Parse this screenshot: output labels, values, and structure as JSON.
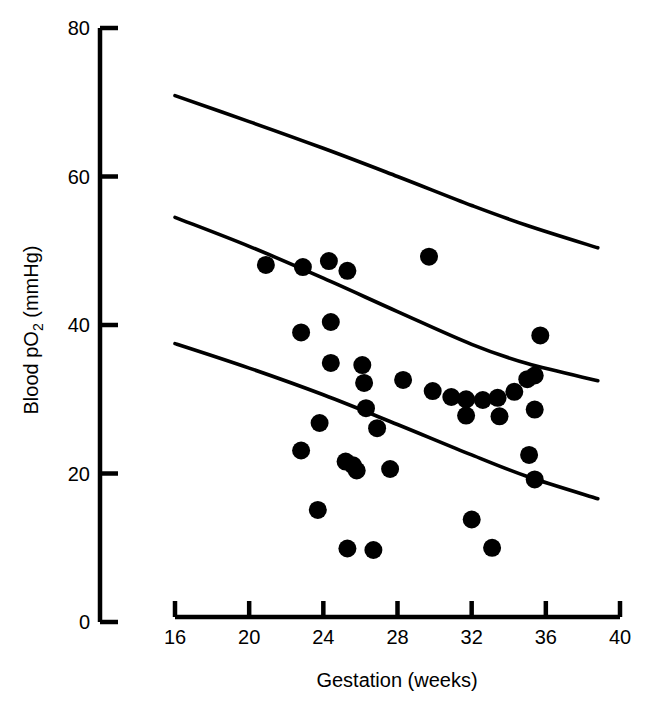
{
  "figure": {
    "background_color": "#ffffff",
    "ink_color": "#000000"
  },
  "chart_data": {
    "type": "scatter",
    "title": "",
    "subtitle": "",
    "xlabel": "Gestation (weeks)",
    "ylabel": "Blood pO2 (mmHg)",
    "ylabel_parts": {
      "prefix": "Blood pO",
      "subscript": "2",
      "suffix": " (mmHg)"
    },
    "xlim": [
      16,
      40
    ],
    "ylim": [
      0,
      80
    ],
    "xticks": [
      16,
      20,
      24,
      28,
      32,
      36,
      40
    ],
    "xtick_labels": [
      "16",
      "20",
      "24",
      "28",
      "32",
      "36",
      "40"
    ],
    "yticks": [
      0,
      20,
      40,
      60,
      80
    ],
    "ytick_labels": [
      "0",
      "20",
      "40",
      "60",
      "80"
    ],
    "grid": false,
    "legend": null,
    "marker": {
      "shape": "circle",
      "color": "#000000",
      "radius_px": 9
    },
    "x": [
      20.9,
      22.9,
      24.3,
      25.3,
      29.7,
      22.8,
      24.4,
      35.7,
      24.4,
      26.1,
      26.2,
      28.3,
      29.9,
      30.9,
      31.7,
      32.6,
      33.4,
      34.3,
      35.0,
      35.4,
      31.7,
      33.5,
      35.4,
      23.8,
      26.3,
      26.9,
      22.8,
      25.2,
      25.6,
      25.8,
      27.6,
      35.1,
      35.4,
      23.7,
      32.0,
      25.3,
      26.7,
      33.1
    ],
    "y": [
      48.1,
      47.8,
      48.6,
      47.3,
      49.2,
      39.0,
      40.4,
      38.6,
      34.9,
      34.6,
      32.2,
      32.6,
      31.1,
      30.3,
      30.0,
      29.9,
      30.2,
      31.0,
      32.7,
      33.2,
      27.8,
      27.7,
      28.6,
      26.8,
      28.8,
      26.1,
      23.1,
      21.6,
      21.1,
      20.4,
      20.6,
      22.5,
      19.2,
      15.1,
      13.8,
      9.9,
      9.7,
      10.0
    ],
    "points": [
      {
        "x": 20.9,
        "y": 48.1
      },
      {
        "x": 22.9,
        "y": 47.8
      },
      {
        "x": 24.3,
        "y": 48.6
      },
      {
        "x": 25.3,
        "y": 47.3
      },
      {
        "x": 29.7,
        "y": 49.2
      },
      {
        "x": 22.8,
        "y": 39.0
      },
      {
        "x": 24.4,
        "y": 40.4
      },
      {
        "x": 35.7,
        "y": 38.6
      },
      {
        "x": 24.4,
        "y": 34.9
      },
      {
        "x": 26.1,
        "y": 34.6
      },
      {
        "x": 26.2,
        "y": 32.2
      },
      {
        "x": 28.3,
        "y": 32.6
      },
      {
        "x": 29.9,
        "y": 31.1
      },
      {
        "x": 30.9,
        "y": 30.3
      },
      {
        "x": 31.7,
        "y": 30.0
      },
      {
        "x": 32.6,
        "y": 29.9
      },
      {
        "x": 33.4,
        "y": 30.2
      },
      {
        "x": 34.3,
        "y": 31.0
      },
      {
        "x": 35.0,
        "y": 32.7
      },
      {
        "x": 35.4,
        "y": 33.2
      },
      {
        "x": 31.7,
        "y": 27.8
      },
      {
        "x": 33.5,
        "y": 27.7
      },
      {
        "x": 35.4,
        "y": 28.6
      },
      {
        "x": 23.8,
        "y": 26.8
      },
      {
        "x": 26.3,
        "y": 28.8
      },
      {
        "x": 26.9,
        "y": 26.1
      },
      {
        "x": 22.8,
        "y": 23.1
      },
      {
        "x": 25.2,
        "y": 21.6
      },
      {
        "x": 25.6,
        "y": 21.1
      },
      {
        "x": 25.8,
        "y": 20.4
      },
      {
        "x": 27.6,
        "y": 20.6
      },
      {
        "x": 35.1,
        "y": 22.5
      },
      {
        "x": 35.4,
        "y": 19.2
      },
      {
        "x": 23.7,
        "y": 15.1
      },
      {
        "x": 32.0,
        "y": 13.8
      },
      {
        "x": 25.3,
        "y": 9.9
      },
      {
        "x": 26.7,
        "y": 9.7
      },
      {
        "x": 33.1,
        "y": 10.0
      }
    ],
    "n_points": 38,
    "reference_curves": [
      {
        "name": "upper-reference-curve",
        "x": [
          16.0,
          20.0,
          24.0,
          28.0,
          32.0,
          35.0,
          38.8
        ],
        "y": [
          70.9,
          67.4,
          63.8,
          60.0,
          56.1,
          53.4,
          50.4
        ]
      },
      {
        "name": "middle-reference-curve",
        "x": [
          16.0,
          20.0,
          24.0,
          28.0,
          32.0,
          35.0,
          38.8
        ],
        "y": [
          54.5,
          50.6,
          46.3,
          41.8,
          37.4,
          34.8,
          32.5
        ]
      },
      {
        "name": "lower-reference-curve",
        "x": [
          16.0,
          20.0,
          24.0,
          28.0,
          32.0,
          35.0,
          38.8
        ],
        "y": [
          37.5,
          34.2,
          30.6,
          26.6,
          22.5,
          19.6,
          16.6
        ]
      }
    ]
  }
}
